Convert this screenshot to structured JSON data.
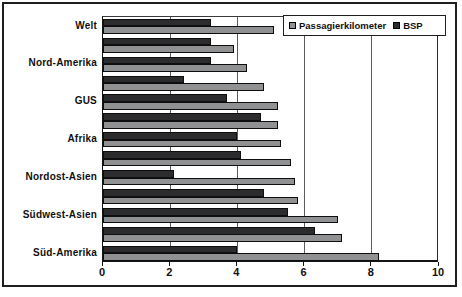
{
  "figure": {
    "background": "#ffffff",
    "frame_border_color": "#1f1f1f",
    "title": ""
  },
  "chart_data": {
    "type": "bar",
    "orientation": "horizontal",
    "title": "",
    "xlabel": "",
    "ylabel": "",
    "xlim": [
      0,
      10
    ],
    "x_ticks": [
      "0",
      "2",
      "4",
      "6",
      "8",
      "10"
    ],
    "grid": "vertical",
    "gridline_color": "#5c5c5c",
    "legend_position": "top-right",
    "categories": [
      "Welt",
      "",
      "Nord-Amerika",
      "",
      "GUS",
      "",
      "Afrika",
      "",
      "Nordost-Asien",
      "",
      "Südwest-Asien",
      "",
      "Süd-Amerika"
    ],
    "visible_category_labels": [
      "Welt",
      "Nord-Amerika",
      "GUS",
      "Afrika",
      "Nordost-Asien",
      "Südwest-Asien",
      "Süd-Amerika"
    ],
    "series": [
      {
        "name": "Passagierkilometer",
        "color": "#8f9193",
        "values": [
          5.1,
          3.9,
          4.3,
          4.8,
          5.2,
          5.2,
          5.3,
          5.6,
          5.7,
          5.8,
          7.0,
          7.1,
          8.2
        ]
      },
      {
        "name": "BSP",
        "color": "#2c2c2e",
        "values": [
          3.2,
          3.2,
          3.2,
          2.4,
          3.7,
          4.7,
          4.0,
          4.1,
          2.1,
          4.8,
          5.5,
          6.3,
          4.0
        ]
      }
    ]
  }
}
